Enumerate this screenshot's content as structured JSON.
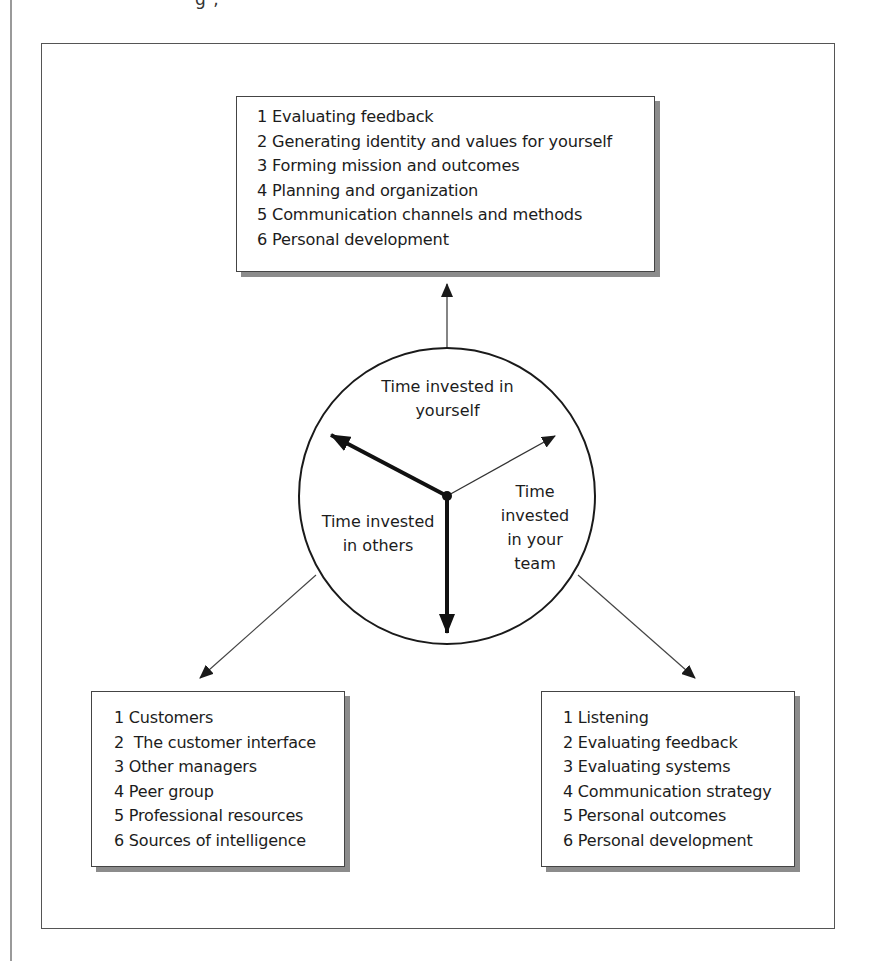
{
  "page": {
    "top_fragment": "g  ,",
    "colors": {
      "line": "#1a1a1a",
      "frame": "#555555",
      "shadow": "#8c8c8c",
      "background": "#ffffff"
    }
  },
  "diagram": {
    "clock": {
      "sections": {
        "yourself": "Time invested in\nyourself",
        "others": "Time invested\nin others",
        "team": "Time\ninvested\nin your\nteam"
      },
      "hands": [
        {
          "name": "others-hand",
          "direction": "upper-left",
          "weight": "thick"
        },
        {
          "name": "team-hand",
          "direction": "upper-right",
          "weight": "thin"
        },
        {
          "name": "yourself-hand",
          "direction": "down",
          "weight": "thick"
        }
      ]
    },
    "boxes": {
      "yourself": {
        "items": [
          "1 Evaluating feedback",
          "2 Generating identity and values for yourself",
          "3 Forming mission and outcomes",
          "4 Planning and organization",
          "5 Communication channels and methods",
          "6 Personal development"
        ]
      },
      "others": {
        "items": [
          "1 Customers",
          "2  The customer interface",
          "3 Other managers",
          "4 Peer group",
          "5 Professional resources",
          "6 Sources of intelligence"
        ]
      },
      "team": {
        "items": [
          "1 Listening",
          "2 Evaluating feedback",
          "3 Evaluating systems",
          "4 Communication strategy",
          "5 Personal outcomes",
          "6 Personal development"
        ]
      }
    }
  }
}
